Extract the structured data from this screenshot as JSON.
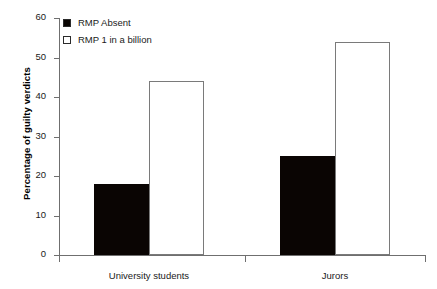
{
  "chart_data": {
    "type": "bar",
    "title": "",
    "xlabel": "",
    "ylabel": "Percentage of guilty verdicts",
    "categories": [
      "University students",
      "Jurors"
    ],
    "series": [
      {
        "name": "RMP Absent",
        "values": [
          18,
          25
        ],
        "color": "#000000",
        "fill": "solid"
      },
      {
        "name": "RMP 1 in a billion",
        "values": [
          44,
          54
        ],
        "color": "#ffffff",
        "fill": "hollow"
      }
    ],
    "ylim": [
      0,
      60
    ],
    "yticks": [
      0,
      10,
      20,
      30,
      40,
      50,
      60
    ],
    "ytick_labels": [
      "0",
      "10",
      "20",
      "30",
      "40",
      "50",
      "60"
    ],
    "grid": false,
    "legend_position": "top-left"
  },
  "legend": {
    "items": [
      {
        "label": "RMP Absent",
        "style": "filled"
      },
      {
        "label": "RMP 1 in a billion",
        "style": "hollow"
      }
    ]
  }
}
